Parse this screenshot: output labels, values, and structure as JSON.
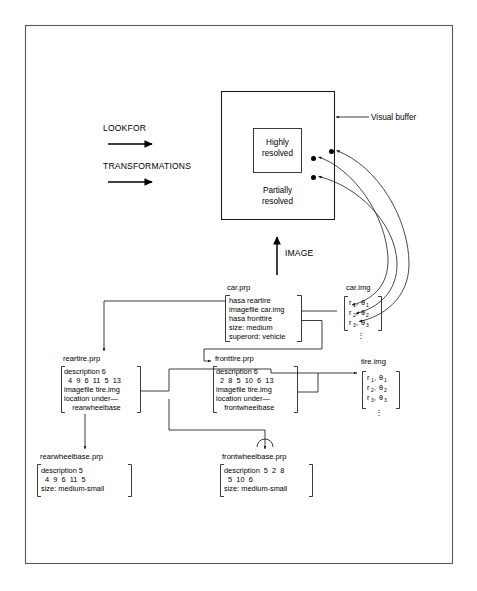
{
  "figure": {
    "page_border_color": "#59595b",
    "ink_color": "#1a1a1a"
  },
  "process_labels": {
    "lookfor": "LOOKFOR",
    "transformations": "TRANSFORMATIONS",
    "image": "IMAGE"
  },
  "visual_buffer": {
    "callout": "Visual buffer",
    "inner_region": "Highly\nresolved",
    "inner_region_line1": "Highly",
    "inner_region_line2": "resolved",
    "outer_region_line1": "Partially",
    "outer_region_line2": "resolved"
  },
  "boxes": {
    "car_prp": {
      "title": "car.prp",
      "lines": [
        "hasa reartire",
        "imagefile car.img",
        "hasa fronttire",
        "size: medium",
        "superord: vehicle"
      ]
    },
    "reartire_prp": {
      "title": "reartire.prp",
      "lines": [
        "description 6",
        "  4  9  6  11  5  13",
        "imagefile tire.img",
        "location under—",
        "    rearwheelbase"
      ]
    },
    "fronttire_prp": {
      "title": "fronttire.prp",
      "lines": [
        "description 6",
        "  2  8  5  10  6  13",
        "imagefile tire.img",
        "location under—",
        "    frontwheelbase"
      ]
    },
    "rearwheelbase_prp": {
      "title": "rearwheelbase.prp",
      "lines": [
        "description 5",
        "  4  9  6  11  5",
        "size: medium-small"
      ]
    },
    "frontwheelbase_prp": {
      "title": "frontwheelbase.prp",
      "lines": [
        "description  5  2  8",
        "  5  10  6",
        "size: medium-small"
      ]
    },
    "car_img": {
      "title": "car.img",
      "rows": [
        {
          "r": "r",
          "r_sub": "1",
          "theta": "θ",
          "theta_sub": "1"
        },
        {
          "r": "r",
          "r_sub": "2",
          "theta": "θ",
          "theta_sub": "2"
        },
        {
          "r": "r",
          "r_sub": "3",
          "theta": "θ",
          "theta_sub": "3"
        }
      ],
      "continuation": "⋮"
    },
    "tire_img": {
      "title": "tire.img",
      "rows": [
        {
          "r": "r",
          "r_sub": "1",
          "theta": "θ",
          "theta_sub": "1"
        },
        {
          "r": "r",
          "r_sub": "2",
          "theta": "θ",
          "theta_sub": "2"
        },
        {
          "r": "r",
          "r_sub": "3",
          "theta": "θ",
          "theta_sub": "3"
        }
      ],
      "continuation": "⋮"
    }
  }
}
